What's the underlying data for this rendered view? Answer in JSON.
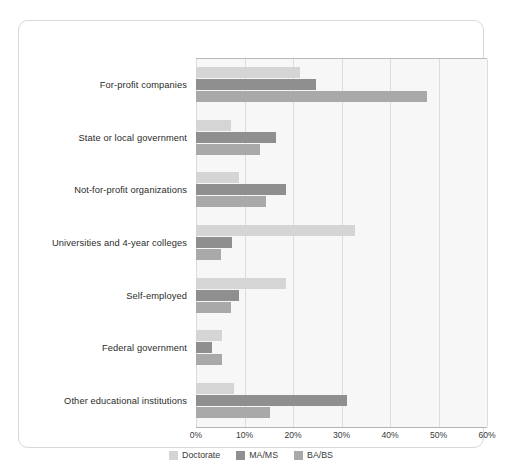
{
  "chart_data": {
    "type": "bar",
    "orientation": "horizontal",
    "title": "",
    "xlabel": "",
    "ylabel": "",
    "xlim": [
      0,
      60
    ],
    "xticks": [
      "0%",
      "10%",
      "20%",
      "30%",
      "40%",
      "50%",
      "60%"
    ],
    "xtick_values": [
      0,
      10,
      20,
      30,
      40,
      50,
      60
    ],
    "grid": true,
    "legend_position": "bottom-center",
    "categories": [
      "For-profit companies",
      "State or local government",
      "Not-for-profit organizations",
      "Universities and 4-year colleges",
      "Self-employed",
      "Federal government",
      "Other educational institutions"
    ],
    "series": [
      {
        "name": "Doctorate",
        "color": "#d5d5d5",
        "values": [
          21.4,
          7.2,
          8.9,
          32.8,
          18.6,
          5.4,
          7.8
        ]
      },
      {
        "name": "MA/MS",
        "color": "#8f8f8f",
        "values": [
          24.7,
          16.5,
          18.6,
          7.4,
          8.9,
          3.2,
          31.1
        ]
      },
      {
        "name": "BA/BS",
        "color": "#a9a9a9",
        "values": [
          47.6,
          13.2,
          14.4,
          5.2,
          7.2,
          5.4,
          15.3
        ]
      }
    ]
  },
  "style": {
    "plot_background": "#f7f7f7",
    "gridline_color": "#dcdcdc",
    "card_border_color": "#d8d8d8",
    "page_background": "#ffffff",
    "label_color": "#2b2b2b"
  }
}
